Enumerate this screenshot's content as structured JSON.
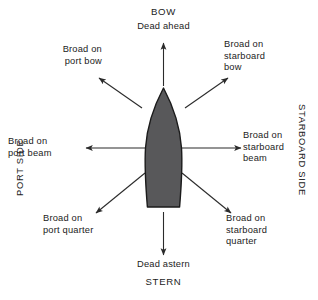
{
  "diagram": {
    "title_top": "BOW",
    "title_bottom": "STERN",
    "side_labels": {
      "port": "PORT SIDE",
      "starboard": "STARBOARD SIDE"
    },
    "bearings": {
      "dead_ahead": "Dead ahead",
      "dead_astern": "Dead astern",
      "broad_port_bow": "Broad on\nport bow",
      "broad_starboard_bow": "Broad on\nstarboard\nbow",
      "broad_port_beam": "Broad on\nport beam",
      "broad_starboard_beam": "Broad on\nstarboard\nbeam",
      "broad_port_quarter": "Broad on\nport quarter",
      "broad_starboard_quarter": "Broad on\nstarboard\nquarter"
    },
    "colors": {
      "hull_fill": "#58585a",
      "hull_stroke": "#1b1b1b",
      "arrow": "#2b2b2b",
      "text": "#1b1b1b",
      "background": "#ffffff"
    }
  }
}
